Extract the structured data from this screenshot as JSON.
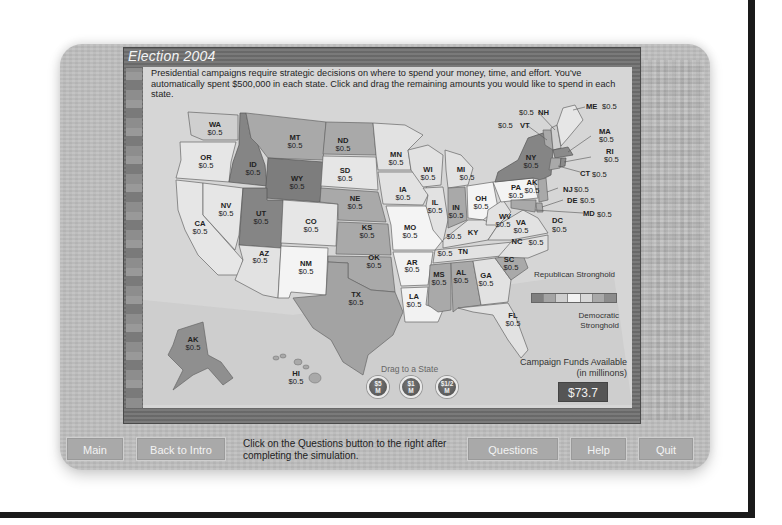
{
  "window": {
    "title": "Election 2004",
    "intro_text": "Presidential campaigns require strategic decisions on where to spend your money, time, and effort. You've automatically spent $500,000 in each state. Click and drag the remaining amounts you would like to spend in each state."
  },
  "map": {
    "states": [
      {
        "code": "WA",
        "value": "$0.5",
        "shade": "light"
      },
      {
        "code": "OR",
        "value": "$0.5",
        "shade": "light"
      },
      {
        "code": "CA",
        "value": "$0.5",
        "shade": "light"
      },
      {
        "code": "NV",
        "value": "$0.5",
        "shade": "light"
      },
      {
        "code": "ID",
        "value": "$0.5",
        "shade": "dark-rep"
      },
      {
        "code": "MT",
        "value": "$0.5",
        "shade": "mid-rep"
      },
      {
        "code": "WY",
        "value": "$0.5",
        "shade": "dark-rep"
      },
      {
        "code": "UT",
        "value": "$0.5",
        "shade": "dark-rep"
      },
      {
        "code": "AZ",
        "value": "$0.5",
        "shade": "light"
      },
      {
        "code": "CO",
        "value": "$0.5",
        "shade": "lighter"
      },
      {
        "code": "NM",
        "value": "$0.5",
        "shade": "white"
      },
      {
        "code": "ND",
        "value": "$0.5",
        "shade": "mid-rep"
      },
      {
        "code": "SD",
        "value": "$0.5",
        "shade": "lighter"
      },
      {
        "code": "NE",
        "value": "$0.5",
        "shade": "mid-rep"
      },
      {
        "code": "KS",
        "value": "$0.5",
        "shade": "mid-rep"
      },
      {
        "code": "OK",
        "value": "$0.5",
        "shade": "mid-rep"
      },
      {
        "code": "TX",
        "value": "$0.5",
        "shade": "mid-rep"
      },
      {
        "code": "MN",
        "value": "$0.5",
        "shade": "light"
      },
      {
        "code": "IA",
        "value": "$0.5",
        "shade": "light"
      },
      {
        "code": "MO",
        "value": "$0.5",
        "shade": "white"
      },
      {
        "code": "AR",
        "value": "$0.5",
        "shade": "white"
      },
      {
        "code": "LA",
        "value": "$0.5",
        "shade": "white"
      },
      {
        "code": "WI",
        "value": "$0.5",
        "shade": "light"
      },
      {
        "code": "IL",
        "value": "$0.5",
        "shade": "light"
      },
      {
        "code": "MI",
        "value": "$0.5",
        "shade": "light"
      },
      {
        "code": "IN",
        "value": "$0.5",
        "shade": "mid-rep"
      },
      {
        "code": "OH",
        "value": "$0.5",
        "shade": "white"
      },
      {
        "code": "KY",
        "value": "$0.5",
        "shade": "light"
      },
      {
        "code": "TN",
        "value": "$0.5",
        "shade": "light"
      },
      {
        "code": "MS",
        "value": "$0.5",
        "shade": "mid-rep"
      },
      {
        "code": "AL",
        "value": "$0.5",
        "shade": "mid-rep"
      },
      {
        "code": "GA",
        "value": "$0.5",
        "shade": "light"
      },
      {
        "code": "FL",
        "value": "$0.5",
        "shade": "light"
      },
      {
        "code": "SC",
        "value": "$0.5",
        "shade": "mid-rep"
      },
      {
        "code": "NC",
        "value": "$0.5",
        "shade": "light"
      },
      {
        "code": "VA",
        "value": "$0.5",
        "shade": "light"
      },
      {
        "code": "WV",
        "value": "$0.5",
        "shade": "light"
      },
      {
        "code": "PA",
        "value": "$0.5",
        "shade": "white"
      },
      {
        "code": "NY",
        "value": "$0.5",
        "shade": "dark-dem"
      },
      {
        "code": "VT",
        "value": "$0.5",
        "shade": "mid-dem"
      },
      {
        "code": "NH",
        "value": "$0.5",
        "shade": "light"
      },
      {
        "code": "ME",
        "value": "$0.5",
        "shade": "lighter"
      },
      {
        "code": "MA",
        "value": "$0.5",
        "shade": "dark-dem"
      },
      {
        "code": "RI",
        "value": "$0.5",
        "shade": "dark-dem"
      },
      {
        "code": "CT",
        "value": "$0.5",
        "shade": "mid-dem"
      },
      {
        "code": "NJ",
        "value": "$0.5",
        "shade": "mid-dem"
      },
      {
        "code": "DE",
        "value": "$0.5",
        "shade": "mid-dem"
      },
      {
        "code": "MD",
        "value": "$0.5",
        "shade": "mid-dem"
      },
      {
        "code": "DC",
        "value": "$0.5",
        "shade": "dark-dem"
      },
      {
        "code": "AK",
        "value": "$0.5",
        "shade": "mid-rep"
      },
      {
        "code": "HI",
        "value": "$0.5",
        "shade": "mid-dem"
      }
    ],
    "shade_colors": {
      "dark-rep": "#858585",
      "mid-rep": "#a3a3a3",
      "light": "#cfcfcf",
      "lighter": "#e0e0e0",
      "white": "#f2f2f2",
      "mid-dem": "#a9a9a9",
      "dark-dem": "#8a8a8a"
    }
  },
  "legend": {
    "republican_label": "Republican Stronghold",
    "democratic_label": "Democratic Stronghold",
    "swatches": [
      "#7f7f7f",
      "#a4a4a4",
      "#cfcfcf",
      "#f2f2f2",
      "#d8d8d8",
      "#a9a9a9",
      "#8c8c8c"
    ]
  },
  "drag": {
    "label": "Drag to a State",
    "coins": [
      {
        "amount": "$5",
        "unit": "M"
      },
      {
        "amount": "$1",
        "unit": "M"
      },
      {
        "amount": "$1/2",
        "unit": "M"
      }
    ]
  },
  "funds": {
    "label": "Campaign Funds Available (in millinons)",
    "value": "$73.7"
  },
  "footer": {
    "main_label": "Main",
    "back_label": "Back to Intro",
    "message": "Click on the Questions button to the right after completing the simulation.",
    "questions_label": "Questions",
    "help_label": "Help",
    "quit_label": "Quit"
  }
}
